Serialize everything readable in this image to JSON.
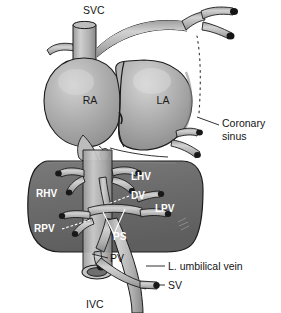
{
  "figure": {
    "background_color": "#ffffff"
  },
  "colors": {
    "background": "#ffffff",
    "liver_fill": "#6e6e6e",
    "liver_edge": "#1c1c1c",
    "atrium_fill": "#a8a8a8",
    "atrium_highlight": "#cfcfcf",
    "vessel_fill": "#b4b4b4",
    "vessel_highlight": "#d6d6d6",
    "vessel_dark_fill": "#8c8c8c",
    "cut_end": "#1a1a1a",
    "outline": "#1c1c1c",
    "label_dark": "#141414",
    "label_white": "#ffffff"
  },
  "labels": {
    "dark": [
      {
        "id": "svc",
        "text": "SVC",
        "x": 83,
        "y": 14,
        "anchor": "start"
      },
      {
        "id": "coronary_sinus_line1",
        "text": "Coronary",
        "x": 222,
        "y": 127,
        "anchor": "start"
      },
      {
        "id": "coronary_sinus_line2",
        "text": "sinus",
        "x": 222,
        "y": 140,
        "anchor": "start"
      },
      {
        "id": "pv",
        "text": "PV",
        "x": 110,
        "y": 262,
        "anchor": "start"
      },
      {
        "id": "umbilical_vein",
        "text": "L. umbilical vein",
        "x": 168,
        "y": 270,
        "anchor": "start"
      },
      {
        "id": "sv",
        "text": "SV",
        "x": 168,
        "y": 289,
        "anchor": "start"
      },
      {
        "id": "ivc",
        "text": "IVC",
        "x": 86,
        "y": 308,
        "anchor": "start"
      }
    ],
    "chambers": [
      {
        "id": "ra",
        "text": "RA",
        "x": 90,
        "y": 104,
        "anchor": "middle"
      },
      {
        "id": "la",
        "text": "LA",
        "x": 163,
        "y": 104,
        "anchor": "middle"
      }
    ],
    "white": [
      {
        "id": "lhv",
        "text": "LHV",
        "x": 131,
        "y": 180,
        "anchor": "start"
      },
      {
        "id": "rhv",
        "text": "RHV",
        "x": 36,
        "y": 197,
        "anchor": "start"
      },
      {
        "id": "dv",
        "text": "DV",
        "x": 131,
        "y": 199,
        "anchor": "start"
      },
      {
        "id": "lpv",
        "text": "LPV",
        "x": 155,
        "y": 212,
        "anchor": "start"
      },
      {
        "id": "rpv",
        "text": "RPV",
        "x": 34,
        "y": 232,
        "anchor": "start"
      },
      {
        "id": "ps",
        "text": "PS",
        "x": 113,
        "y": 240,
        "anchor": "start"
      }
    ]
  },
  "leaders": {
    "dark": [
      {
        "id": "coronary-sinus-leader",
        "d": "M 219 125 L 197 117"
      },
      {
        "id": "pv-leader",
        "d": "M 108 258 L 92 254"
      },
      {
        "id": "umbilical-vein-leader",
        "d": "M 165 266 L 148 266"
      },
      {
        "id": "sv-leader",
        "d": "M 165 285 L 157 285"
      }
    ],
    "white": [
      {
        "id": "dv-leader",
        "d": "M 129 196 L 107 204"
      },
      {
        "id": "rpv-leader",
        "d": "M 60 229 L 90 220"
      },
      {
        "id": "ps-leader",
        "d": "M 112 235 L 102 213 M 112 235 L 123 209"
      }
    ]
  },
  "structures": {
    "svc": "superior vena cava",
    "ivc": "inferior vena cava",
    "ra": "right atrium",
    "la": "left atrium",
    "aortic_arch": "aortic arch with brachiocephalic branches",
    "ductus_arteriosus": "ductus arteriosus (dotted)",
    "liver": "liver",
    "rhv": "right hepatic vein",
    "lhv": "left hepatic vein",
    "dv": "ductus venosus",
    "rpv": "right portal vein",
    "lpv": "left portal vein",
    "ps": "portal sinus",
    "pv": "portal vein",
    "sv": "splenic vein",
    "umbilical_vein": "left umbilical vein",
    "coronary_sinus": "coronary sinus"
  }
}
